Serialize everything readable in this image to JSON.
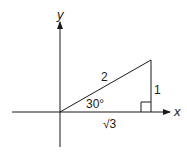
{
  "diagram": {
    "type": "right-triangle-on-axes",
    "axes": {
      "x_label": "x",
      "y_label": "y"
    },
    "triangle": {
      "hypotenuse_label": "2",
      "opposite_label": "1",
      "adjacent_label": "√3",
      "angle_label": "30°",
      "right_angle_marker": true
    },
    "colors": {
      "stroke": "#1a1a1a",
      "background": "#ffffff"
    }
  }
}
